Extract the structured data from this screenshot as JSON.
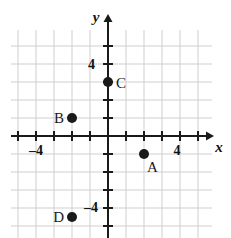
{
  "figure": {
    "type": "coordinate-plane",
    "background_color": "#ffffff",
    "grid_color": "#c9c9c9",
    "axis_color": "#1a1a1a",
    "point_color": "#1a1a1a"
  },
  "axes": {
    "x_axis_label": "x",
    "y_axis_label": "y",
    "x_tick_labels": [
      {
        "value": -4,
        "text": "–4"
      },
      {
        "value": 4,
        "text": "4"
      }
    ],
    "y_tick_labels": [
      {
        "value": 4,
        "text": "4"
      },
      {
        "value": -4,
        "text": "–4"
      }
    ],
    "x_range": [
      -5.4,
      5.8
    ],
    "y_range": [
      -5.7,
      5.9
    ],
    "tick_step": 1,
    "grid": "on"
  },
  "points": [
    {
      "label": "A",
      "x": 2,
      "y": -1,
      "label_side": "below-right"
    },
    {
      "label": "B",
      "x": -2,
      "y": 1,
      "label_side": "left"
    },
    {
      "label": "C",
      "x": 0,
      "y": 3,
      "label_side": "right"
    },
    {
      "label": "D",
      "x": -2,
      "y": -4.5,
      "label_side": "left"
    }
  ],
  "chart_data": {
    "type": "scatter",
    "title": "",
    "xlabel": "x",
    "ylabel": "y",
    "xlim": [
      -5.4,
      5.8
    ],
    "ylim": [
      -5.7,
      5.9
    ],
    "series": [
      {
        "name": "plotted points",
        "points": [
          {
            "name": "A",
            "x": 2,
            "y": -1
          },
          {
            "name": "B",
            "x": -2,
            "y": 1
          },
          {
            "name": "C",
            "x": 0,
            "y": 3
          },
          {
            "name": "D",
            "x": -2,
            "y": -4.5
          }
        ]
      }
    ],
    "grid": true,
    "legend": "none"
  }
}
